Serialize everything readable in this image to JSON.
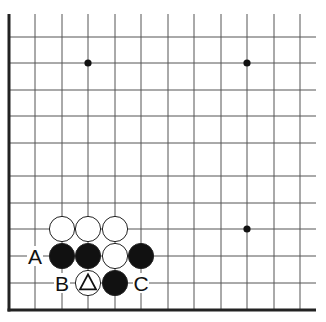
{
  "diagram": {
    "type": "go-board-fragment",
    "view": "lower-left corner region",
    "grid": {
      "columns_visible": 12,
      "rows_visible": 12,
      "spacing_px": 26.5,
      "origin_x": 9,
      "origin_y": 10,
      "left_edge": true,
      "bottom_edge": true
    },
    "star_points": [
      {
        "col": 3,
        "row": 2
      },
      {
        "col": 9,
        "row": 2
      },
      {
        "col": 9,
        "row": 8
      }
    ],
    "stones": [
      {
        "color": "white",
        "col": 2,
        "row": 8
      },
      {
        "color": "white",
        "col": 3,
        "row": 8
      },
      {
        "color": "white",
        "col": 4,
        "row": 8
      },
      {
        "color": "black",
        "col": 2,
        "row": 9
      },
      {
        "color": "black",
        "col": 3,
        "row": 9
      },
      {
        "color": "white",
        "col": 4,
        "row": 9
      },
      {
        "color": "black",
        "col": 5,
        "row": 9
      },
      {
        "color": "white",
        "col": 3,
        "row": 10,
        "marker": "triangle"
      },
      {
        "color": "black",
        "col": 4,
        "row": 10
      }
    ],
    "labels": [
      {
        "text": "A",
        "col": 1,
        "row": 9
      },
      {
        "text": "B",
        "col": 2,
        "row": 10
      },
      {
        "text": "C",
        "col": 5,
        "row": 10
      }
    ],
    "colors": {
      "line": "#555555",
      "edge": "#222222",
      "black_stone": "#111111",
      "white_stone": "#ffffff",
      "background": "#ffffff"
    }
  }
}
